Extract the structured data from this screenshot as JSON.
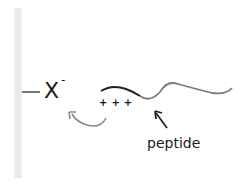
{
  "diagram": {
    "surface_label": "",
    "linker_label": "X",
    "linker_charge": "-",
    "peptide_charges": "+++",
    "peptide_label": "peptide",
    "colors": {
      "surface": "#e8e8e8",
      "linker_line": "#555555",
      "peptide_charged_segment": "#222222",
      "peptide_chain": "#7a7a7a",
      "attraction_arrow": "#888888",
      "pointer_arrow": "#222222",
      "text": "#1a1a1a"
    }
  }
}
